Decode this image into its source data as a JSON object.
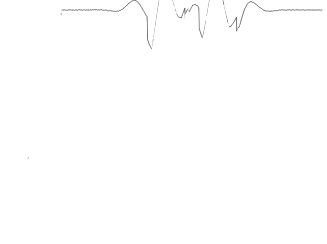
{
  "chart_data": {
    "type": "line",
    "subtype": "ridgeline-waterfall-surface",
    "title": "",
    "subtitle": "",
    "xlabel": "",
    "ylabel": "",
    "zlabel": "",
    "background_color": "#ffffff",
    "line_color": "#000000",
    "fill_color": "#ffffff",
    "line_width": 0.55,
    "grid": false,
    "legend": null,
    "axes_visible": false,
    "tick_labels": [],
    "annotations": [],
    "projection": {
      "type": "sheared-oblique",
      "top_left": [
        62,
        10
      ],
      "top_right": [
        322,
        10
      ],
      "bottom_left": [
        12,
        228
      ],
      "bottom_right": [
        272,
        228
      ],
      "shear_x_per_row": -50,
      "plot_width": 260,
      "plot_height": 218
    },
    "traces": {
      "count": 104,
      "samples_per_trace": 560,
      "hidden_line_removal": true,
      "draw_order": "back-to-front",
      "row_spacing_px": 2.1,
      "amplitude_px": 58
    },
    "surface_function": {
      "description": "Sum of localized sharp ringing bumps arranged on a diagonal lattice",
      "kernel": "exp(-r^2/s^2) * cos(k*r) modulated by a steep sawtooth ridge term",
      "ringing_wavelength": 0.145,
      "envelope_sigma": 0.115,
      "sawtooth_gain": 0.62,
      "noise_amplitude": 0.012
    },
    "peaks": [
      {
        "u": 0.4,
        "v": 0.06,
        "amp": 1.0
      },
      {
        "u": 0.6,
        "v": 0.06,
        "amp": 0.95
      },
      {
        "u": 0.33,
        "v": 0.27,
        "amp": 0.92
      },
      {
        "u": 0.52,
        "v": 0.22,
        "amp": 1.05
      },
      {
        "u": 0.7,
        "v": 0.29,
        "amp": 0.88
      },
      {
        "u": 0.3,
        "v": 0.5,
        "amp": 0.9
      },
      {
        "u": 0.5,
        "v": 0.45,
        "amp": 1.0
      },
      {
        "u": 0.67,
        "v": 0.52,
        "amp": 0.85
      },
      {
        "u": 0.3,
        "v": 0.76,
        "amp": 0.93
      },
      {
        "u": 0.49,
        "v": 0.72,
        "amp": 1.02
      },
      {
        "u": 0.64,
        "v": 0.78,
        "amp": 0.88
      },
      {
        "u": 0.27,
        "v": 0.95,
        "amp": 0.9
      },
      {
        "u": 0.46,
        "v": 0.98,
        "amp": 1.0
      },
      {
        "u": 0.62,
        "v": 0.95,
        "amp": 0.86
      }
    ],
    "x": {
      "min": 0,
      "max": 1,
      "unit": "normalized"
    },
    "y": {
      "min": 0,
      "max": 1,
      "unit": "normalized"
    },
    "z": {
      "min": -0.55,
      "max": 1.15,
      "unit": "normalized"
    }
  },
  "figure": {
    "caption": "",
    "alt_text": "Stacked horizontal line traces forming a sheared parallelogram surface with sharp oscillating peaks"
  }
}
